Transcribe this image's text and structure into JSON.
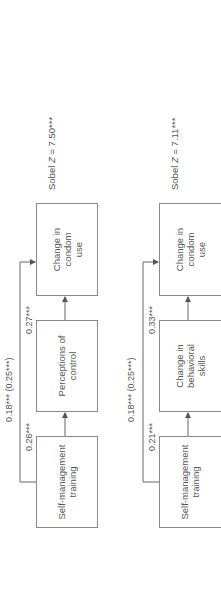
{
  "orientation": "rotated-90-ccw",
  "panels": [
    {
      "id": "panel-1",
      "boxes": {
        "predictor": "Self-management training",
        "mediator": "Perceptions of control",
        "outcome": "Change in condom use"
      },
      "paths": {
        "a": "0.26***",
        "b": "0.27***",
        "c_prime": "0.18*** (0.25***)"
      },
      "sobel": {
        "prefix": "Sobel",
        "stat": "Z",
        "value": "= 7.50***"
      }
    },
    {
      "id": "panel-2",
      "boxes": {
        "predictor": "Self-management training",
        "mediator": "Change in behavioral skills",
        "outcome": "Change in condom use"
      },
      "paths": {
        "a": "0.21***",
        "b": "0.33***",
        "c_prime": "0.18*** (0.25***)"
      },
      "sobel": {
        "prefix": "Sobel",
        "stat": "Z",
        "value": "= 7.11***"
      }
    }
  ],
  "colors": {
    "line": "#666666",
    "border": "#8a8a8a",
    "text": "#555555"
  }
}
